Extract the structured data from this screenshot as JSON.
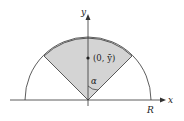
{
  "diagram": {
    "axis_labels": {
      "x": "x",
      "y": "y"
    },
    "point_label": "(0, ȳ)",
    "angle_label": "α",
    "radius_label": "R",
    "colors": {
      "sector_fill": "#d4d4d4",
      "stroke": "#333333",
      "background": "#ffffff"
    }
  }
}
